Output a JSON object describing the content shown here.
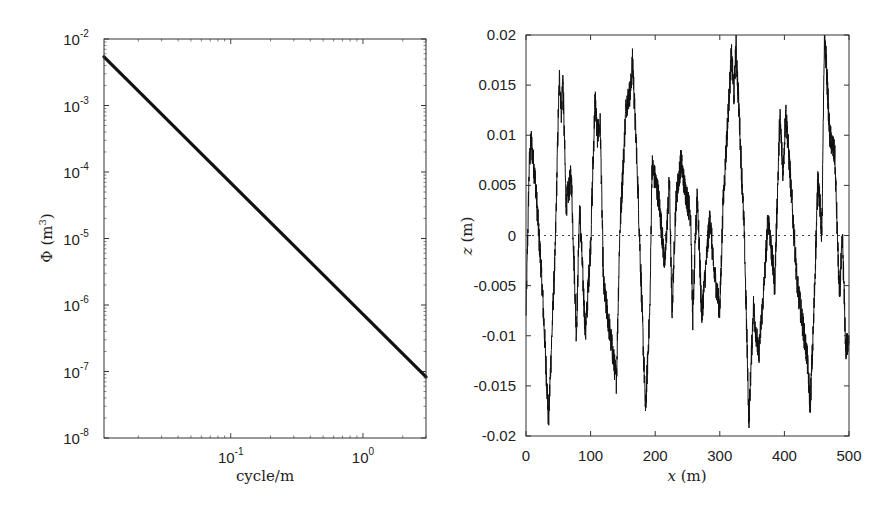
{
  "chart_data": [
    {
      "type": "line",
      "id": "psd",
      "title": "",
      "xlabel": "cycle/m",
      "ylabel": "Φ (m³)",
      "ylabel_base": "Φ (m",
      "ylabel_sup": "3",
      "ylabel_close": ")",
      "x_scale": "log",
      "y_scale": "log",
      "xlim": [
        0.011,
        3.0
      ],
      "ylim": [
        1e-08,
        0.01
      ],
      "x_ticks": [
        {
          "value": 0.1,
          "base": "10",
          "exp": "-1"
        },
        {
          "value": 1,
          "base": "10",
          "exp": "0"
        }
      ],
      "y_ticks": [
        {
          "value": 0.01,
          "base": "10",
          "exp": "-2"
        },
        {
          "value": 0.001,
          "base": "10",
          "exp": "-3"
        },
        {
          "value": 0.0001,
          "base": "10",
          "exp": "-4"
        },
        {
          "value": 1e-05,
          "base": "10",
          "exp": "-5"
        },
        {
          "value": 1e-06,
          "base": "10",
          "exp": "-6"
        },
        {
          "value": 1e-07,
          "base": "10",
          "exp": "-7"
        },
        {
          "value": 1e-08,
          "base": "10",
          "exp": "-8"
        }
      ],
      "grid": false,
      "legend": null,
      "series": [
        {
          "name": "PSD",
          "color": "#111111",
          "line_width": 3.2,
          "x": [
            0.011,
            3.0
          ],
          "y": [
            0.0054,
            8.3e-08
          ]
        }
      ]
    },
    {
      "type": "line",
      "id": "profile",
      "title": "",
      "xlabel": "x (m)",
      "xlabel_var": "x",
      "xlabel_unit": " (m)",
      "ylabel": "z (m)",
      "ylabel_var": "z",
      "ylabel_unit": " (m)",
      "x_scale": "linear",
      "y_scale": "linear",
      "xlim": [
        0,
        500
      ],
      "ylim": [
        -0.02,
        0.02
      ],
      "x_ticks": [
        {
          "value": 0,
          "label": "0"
        },
        {
          "value": 100,
          "label": "100"
        },
        {
          "value": 200,
          "label": "200"
        },
        {
          "value": 300,
          "label": "300"
        },
        {
          "value": 400,
          "label": "400"
        },
        {
          "value": 500,
          "label": "500"
        }
      ],
      "y_ticks": [
        {
          "value": 0.02,
          "label": "0.02"
        },
        {
          "value": 0.015,
          "label": "0.015"
        },
        {
          "value": 0.01,
          "label": "0.01"
        },
        {
          "value": 0.005,
          "label": "0.005"
        },
        {
          "value": 0,
          "label": "0"
        },
        {
          "value": -0.005,
          "label": "-0.005"
        },
        {
          "value": -0.01,
          "label": "-0.01"
        },
        {
          "value": -0.015,
          "label": "-0.015"
        },
        {
          "value": -0.02,
          "label": "-0.02"
        }
      ],
      "grid": false,
      "legend": null,
      "reference_line": {
        "y": 0,
        "style": "dotted",
        "color": "#444444"
      },
      "series": [
        {
          "name": "road profile",
          "color": "#111111",
          "line_width": 1,
          "keypoints_x": [
            0,
            5,
            8,
            15,
            25,
            35,
            40,
            45,
            50,
            52,
            55,
            57,
            62,
            70,
            78,
            83,
            92,
            100,
            107,
            110,
            115,
            120,
            140,
            145,
            155,
            162,
            165,
            172,
            185,
            192,
            195,
            205,
            215,
            222,
            226,
            232,
            240,
            245,
            255,
            258,
            265,
            272,
            285,
            290,
            300,
            305,
            318,
            322,
            325,
            330,
            338,
            345,
            352,
            360,
            368,
            375,
            385,
            393,
            398,
            402,
            410,
            420,
            435,
            440,
            445,
            452,
            458,
            462,
            465,
            470,
            478,
            485,
            490,
            495,
            500
          ],
          "keypoints_z": [
            -0.008,
            0.007,
            0.0095,
            0.005,
            -0.005,
            -0.0185,
            -0.01,
            -0.002,
            0.012,
            0.016,
            0.012,
            0.016,
            0.003,
            0.006,
            -0.01,
            0.003,
            -0.01,
            -0.001,
            0.014,
            0.01,
            0.011,
            -0.005,
            -0.0145,
            0.0,
            0.013,
            0.0145,
            0.0175,
            0.007,
            -0.0175,
            -0.007,
            0.007,
            0.004,
            -0.003,
            0.0055,
            -0.008,
            0.0035,
            0.0075,
            0.005,
            0.002,
            -0.0085,
            0.0045,
            -0.008,
            0.002,
            -0.003,
            -0.0075,
            0.003,
            0.018,
            0.014,
            0.019,
            0.012,
            0.0,
            -0.0185,
            -0.007,
            -0.012,
            -0.0055,
            0.002,
            -0.005,
            0.012,
            0.006,
            0.0125,
            0.005,
            -0.005,
            -0.012,
            -0.017,
            -0.009,
            0.006,
            0.0,
            0.02,
            0.017,
            0.01,
            0.008,
            -0.006,
            -0.0005,
            -0.0115,
            -0.01
          ]
        }
      ]
    }
  ]
}
